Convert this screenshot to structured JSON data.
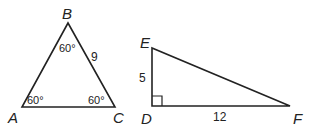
{
  "triangles": [
    {
      "name": "ABC",
      "vertices": {
        "A": "A",
        "B": "B",
        "C": "C"
      },
      "angles": {
        "A": "60°",
        "B": "60°",
        "C": "60°"
      },
      "sides": {
        "BC": "9"
      }
    },
    {
      "name": "DEF",
      "vertices": {
        "D": "D",
        "E": "E",
        "F": "F"
      },
      "right_angle_at": "D",
      "sides": {
        "DE": "5",
        "DF": "12"
      }
    }
  ],
  "colors": {
    "stroke": "#222222",
    "background": "#ffffff"
  }
}
